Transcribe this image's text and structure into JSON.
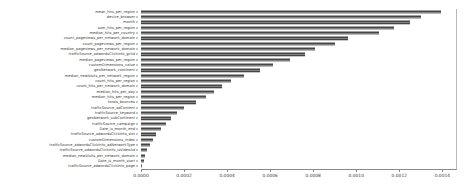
{
  "chart_data": {
    "type": "bar",
    "orientation": "horizontal",
    "title": "",
    "xlabel": "",
    "ylabel": "",
    "xlim": [
      0.0,
      0.0014634
    ],
    "grid": false,
    "legend": null,
    "bar_color": "#4d4d4d",
    "xticks": [
      "0.0000",
      "0.0002",
      "0.0004",
      "0.0006",
      "0.0008",
      "0.0010",
      "0.0012",
      "0.0014"
    ],
    "xtick_values": [
      0.0,
      0.0002,
      0.0004,
      0.0006,
      0.0008,
      0.001,
      0.0012,
      0.0014
    ],
    "categories": [
      "mean_hits_per_region",
      "device_browser",
      "month",
      "sum_hits_per_region",
      "median_hits_per_country",
      "count_pageviews_per_network_domain",
      "count_pageviews_per_region",
      "median_pageviews_per_network_domain",
      "trafficSource_adwordsClickInfo_gclId",
      "median_pageviews_per_region",
      "customDimensions_value",
      "geoNetwork_continent",
      "median_newVisits_per_network_region",
      "count_hits_per_region",
      "count_hits_per_network_domain",
      "median_hits_per_day",
      "median_hits_per_region",
      "totals_bounces",
      "trafficSource_adContent",
      "trafficSource_keyword",
      "geoNetwork_subContinent",
      "trafficSource_campaign",
      "Date_is_month_end",
      "trafficSource_adwordsClickInfo_slot",
      "customDimensions_index",
      "trafficSource_adwordsClickInfo_adNetworkType",
      "trafficSource_adwordsClickInfo_isVideoAd",
      "median_newVisits_per_network_domain",
      "Date_is_month_start",
      "trafficSource_adwordsClickInfo_page"
    ],
    "values": [
      0.001392,
      0.001302,
      0.001252,
      0.001175,
      0.001108,
      0.00096,
      0.0009,
      0.00081,
      0.00076,
      0.00069,
      0.000615,
      0.000555,
      0.00048,
      0.00042,
      0.000375,
      0.000338,
      0.0003,
      0.000255,
      0.0002,
      0.000168,
      0.00014,
      0.000118,
      9.2e-05,
      7.2e-05,
      5.6e-05,
      4.2e-05,
      3e-05,
      2e-05,
      1.2e-05,
      5e-06
    ]
  }
}
